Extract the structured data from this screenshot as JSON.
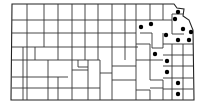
{
  "map": {
    "region": "Kansas counties",
    "colors": {
      "border": "#333333",
      "dot": "#000000",
      "background": "#ffffff"
    },
    "dots": [
      {
        "x": 178,
        "y": 12
      },
      {
        "x": 175,
        "y": 19
      },
      {
        "x": 151,
        "y": 24
      },
      {
        "x": 141,
        "y": 27
      },
      {
        "x": 183,
        "y": 29
      },
      {
        "x": 191,
        "y": 32
      },
      {
        "x": 166,
        "y": 35
      },
      {
        "x": 178,
        "y": 40
      },
      {
        "x": 189,
        "y": 40
      },
      {
        "x": 155,
        "y": 54
      },
      {
        "x": 167,
        "y": 61
      },
      {
        "x": 167,
        "y": 72
      },
      {
        "x": 178,
        "y": 83
      },
      {
        "x": 178,
        "y": 94
      }
    ]
  }
}
